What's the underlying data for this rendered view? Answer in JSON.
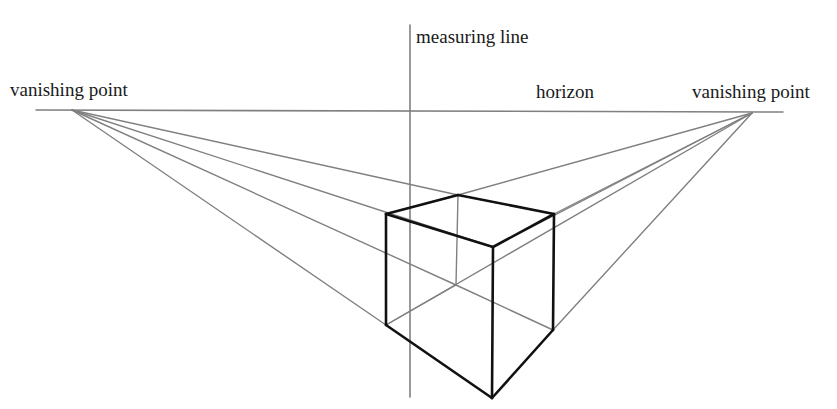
{
  "labels": {
    "left_vp": "vanishing point",
    "right_vp": "vanishing point",
    "measuring_line": "measuring line",
    "horizon": "horizon"
  },
  "colors": {
    "guide_line": "#808080",
    "cube_edge": "#111111",
    "text": "#1a1a1a",
    "background": "#ffffff"
  },
  "geometry": {
    "horizon": {
      "x1": 36,
      "y1": 110,
      "x2": 783,
      "y2": 112
    },
    "measuring_line": {
      "x": 410,
      "y1": 25,
      "y2": 397
    },
    "left_vp": {
      "x": 72,
      "y": 110
    },
    "right_vp": {
      "x": 752,
      "y": 113
    },
    "cube": {
      "top_back": [
        458,
        195
      ],
      "top_left": [
        386,
        214
      ],
      "top_front": [
        493,
        247
      ],
      "top_right": [
        554,
        214
      ],
      "bottom_back": [
        456,
        285
      ],
      "bottom_left": [
        386,
        325
      ],
      "bottom_front": [
        492,
        398
      ],
      "bottom_right": [
        553,
        330
      ]
    }
  }
}
